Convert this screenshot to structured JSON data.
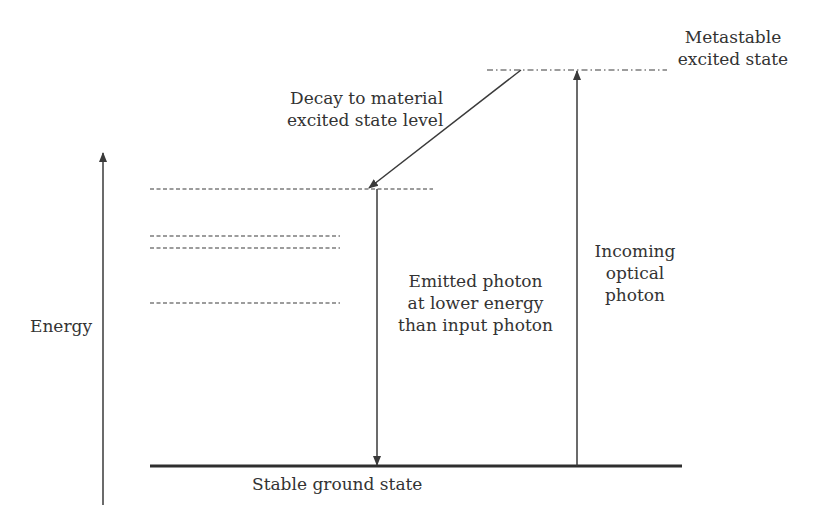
{
  "diagram": {
    "type": "energy-level-diagram",
    "colors": {
      "line": "#3a3a3a",
      "text": "#333333",
      "background": "#ffffff"
    },
    "axis": {
      "label": "Energy",
      "direction": "up"
    },
    "levels": [
      {
        "name": "Metastable excited state",
        "style": "dash-dot"
      },
      {
        "name": "Material excited state level",
        "style": "dashed"
      },
      {
        "name": "Intermediate level 1",
        "style": "dashed"
      },
      {
        "name": "Intermediate level 2",
        "style": "dashed"
      },
      {
        "name": "Intermediate level 3",
        "style": "dashed"
      },
      {
        "name": "Stable ground state",
        "style": "solid"
      }
    ],
    "labels": {
      "metastable_line1": "Metastable",
      "metastable_line2": "excited state",
      "decay_line1": "Decay to material",
      "decay_line2": "excited state level",
      "emitted_line1": "Emitted photon",
      "emitted_line2": "at lower energy",
      "emitted_line3": "than input photon",
      "incoming_line1": "Incoming",
      "incoming_line2": "optical",
      "incoming_line3": "photon",
      "ground": "Stable ground state",
      "energy": "Energy"
    },
    "transitions": [
      {
        "name": "Incoming optical photon",
        "from": "Stable ground state",
        "to": "Metastable excited state"
      },
      {
        "name": "Decay to material excited state level",
        "from": "Metastable excited state",
        "to": "Material excited state level"
      },
      {
        "name": "Emitted photon at lower energy than input photon",
        "from": "Material excited state level",
        "to": "Stable ground state"
      }
    ]
  }
}
